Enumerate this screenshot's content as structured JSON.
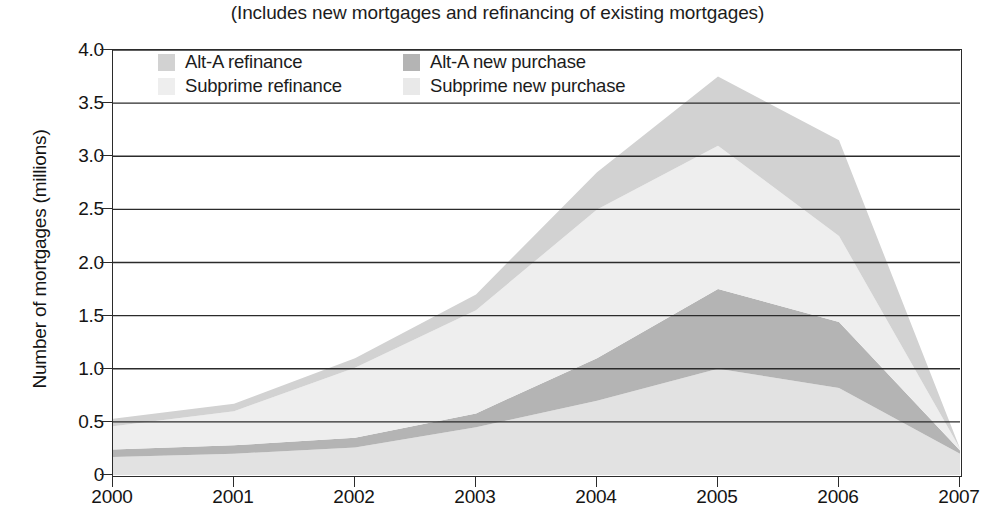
{
  "chart_data": {
    "type": "area",
    "title": "",
    "subtitle": "(Includes new mortgages and refinancing of existing mortgages)",
    "xlabel": "",
    "ylabel": "Number of mortgages (millions)",
    "stacked": true,
    "grid": true,
    "legend_position": "inside-top-left",
    "x": [
      2000,
      2001,
      2002,
      2003,
      2004,
      2005,
      2006,
      2007
    ],
    "x_tick_labels": [
      "2000",
      "2001",
      "2002",
      "2003",
      "2004",
      "2005",
      "2006",
      "2007"
    ],
    "xlim": [
      2000,
      2007
    ],
    "ylim": [
      0,
      4.0
    ],
    "y_tick_values": [
      0,
      0.5,
      1.0,
      1.5,
      2.0,
      2.5,
      3.0,
      3.5,
      4.0
    ],
    "y_tick_labels": [
      "0",
      "0.5",
      "1.0",
      "1.5",
      "2.0",
      "2.5",
      "3.0",
      "3.5",
      "4.0"
    ],
    "series": [
      {
        "name": "Subprime new purchase",
        "color": "#e2e2e2",
        "stack_order": 1,
        "values": [
          0.17,
          0.2,
          0.26,
          0.45,
          0.7,
          1.0,
          0.82,
          0.2
        ]
      },
      {
        "name": "Alt-A new purchase",
        "color": "#b4b4b4",
        "stack_order": 2,
        "values": [
          0.07,
          0.08,
          0.09,
          0.13,
          0.4,
          0.75,
          0.62,
          0.03
        ]
      },
      {
        "name": "Subprime refinance",
        "color": "#eeeeee",
        "stack_order": 3,
        "values": [
          0.22,
          0.32,
          0.66,
          0.97,
          1.4,
          1.35,
          0.81,
          0.02
        ]
      },
      {
        "name": "Alt-A refinance",
        "color": "#d2d2d2",
        "stack_order": 4,
        "values": [
          0.07,
          0.07,
          0.09,
          0.15,
          0.35,
          0.65,
          0.9,
          0.0
        ]
      }
    ],
    "cumulative_tops": {
      "subprime_new_purchase": [
        0.17,
        0.2,
        0.26,
        0.45,
        0.7,
        1.0,
        0.82,
        0.2
      ],
      "alt_a_new_purchase": [
        0.24,
        0.28,
        0.35,
        0.58,
        1.1,
        1.75,
        1.44,
        0.23
      ],
      "subprime_refinance": [
        0.46,
        0.6,
        1.01,
        1.55,
        2.5,
        3.1,
        2.25,
        0.25
      ],
      "alt_a_refinance": [
        0.53,
        0.67,
        1.1,
        1.7,
        2.85,
        3.75,
        3.15,
        0.25
      ]
    },
    "totals": [
      0.53,
      0.67,
      1.1,
      1.7,
      2.85,
      3.75,
      3.15,
      0.25
    ]
  },
  "legend": {
    "entries": [
      {
        "label": "Alt-A refinance",
        "color": "#d2d2d2",
        "row": 0,
        "col": 0
      },
      {
        "label": "Alt-A new purchase",
        "color": "#b4b4b4",
        "row": 0,
        "col": 1
      },
      {
        "label": "Subprime refinance",
        "color": "#eeeeee",
        "row": 1,
        "col": 0
      },
      {
        "label": "Subprime new purchase",
        "color": "#e9e9e9",
        "row": 1,
        "col": 1
      }
    ]
  },
  "axes": {
    "y_title": "Number of mortgages (millions)"
  }
}
